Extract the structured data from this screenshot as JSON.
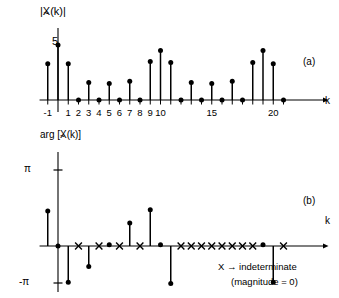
{
  "figure": {
    "panel_a_label": "(a)",
    "panel_b_label": "(b)",
    "magnitude_axis_label_pre": "|X",
    "magnitude_axis_label_post": "(k)|",
    "phase_axis_label_pre": "arg [X",
    "phase_axis_label_post": "(k)]",
    "k_axis_label": "k",
    "magnitude_peak_label": "5",
    "pi_label": "π",
    "neg_pi_label": "-π",
    "legend_line1": "X → indeterminate",
    "legend_line2": "(magnitude = 0)",
    "legend_symbol": "X",
    "legend_arrow": "→",
    "legend_word": "indeterminate"
  },
  "chart_data": [
    {
      "type": "line",
      "plot_style": "stem",
      "title": "",
      "subtitle": "(a)",
      "ylabel": "|X~(k)|",
      "xlabel": "k",
      "xlim": [
        -1.8,
        23.0
      ],
      "ylim": [
        0,
        5.6
      ],
      "grid": false,
      "legend": "none",
      "x": [
        -1,
        0,
        1,
        2,
        3,
        4,
        5,
        6,
        7,
        8,
        9,
        10,
        11,
        12,
        13,
        14,
        15,
        16,
        17,
        18,
        19,
        20,
        21,
        22
      ],
      "values": [
        3.3,
        5.0,
        3.3,
        0.0,
        1.6,
        0.0,
        1.5,
        0.0,
        1.7,
        0.0,
        3.5,
        4.5,
        3.4,
        0.0,
        1.6,
        0.0,
        1.5,
        0.0,
        1.7,
        0.0,
        3.4,
        4.5,
        3.3,
        0.0
      ],
      "xticks": [
        -1,
        1,
        2,
        3,
        4,
        5,
        6,
        7,
        8,
        9,
        10,
        11,
        12,
        13,
        14,
        15,
        16,
        17,
        18,
        19,
        20,
        21,
        22
      ],
      "xticklabels": [
        "-1",
        "1",
        "2",
        "3",
        "4",
        "5",
        "6",
        "7",
        "8",
        "9",
        "10",
        "",
        "",
        "",
        "",
        "15",
        "",
        "",
        "",
        "",
        "",
        "20",
        "",
        ""
      ],
      "yticks": [
        5
      ],
      "yticklabels": [
        "5"
      ],
      "annotations": [
        "5 marks the peak magnitude at k=0"
      ]
    },
    {
      "type": "line",
      "plot_style": "stem",
      "title": "",
      "subtitle": "(b)",
      "ylabel": "arg [X~(k)]",
      "xlabel": "k",
      "xlim": [
        -1.8,
        23.0
      ],
      "ylim": [
        -3.4,
        3.4
      ],
      "grid": false,
      "legend": "X indeterminate (magnitude = 0)",
      "x": [
        -1,
        0,
        1,
        2,
        3,
        4,
        5,
        6,
        7,
        8,
        9,
        10,
        11,
        12,
        13,
        14,
        15,
        16,
        17,
        18,
        19,
        20,
        21,
        22
      ],
      "values": [
        1.45,
        0.0,
        -1.5,
        null,
        -0.85,
        null,
        0.05,
        null,
        0.95,
        null,
        1.5,
        0.05,
        -1.55,
        null,
        -0.8,
        null,
        0.05,
        null,
        1.0,
        null,
        1.5,
        0.05,
        -1.5,
        null
      ],
      "indeterminate_x": [
        2,
        4,
        6,
        8,
        13,
        15,
        17,
        19,
        22
      ],
      "yticks": [
        3.14159,
        0,
        -3.14159
      ],
      "yticklabels": [
        "π",
        "",
        "-π"
      ],
      "annotations": [
        "X marks indicate indeterminate phase where magnitude = 0"
      ]
    }
  ]
}
